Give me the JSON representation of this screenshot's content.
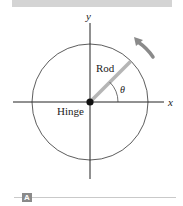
{
  "figure": {
    "tag": "A",
    "labels": {
      "y_axis": "y",
      "x_axis": "x",
      "rod": "Rod",
      "hinge": "Hinge",
      "angle": "θ"
    },
    "colors": {
      "rod": "#b5b5b5",
      "arrow": "#8a8a8a",
      "axes": "#222222",
      "band": "#d4d4d4",
      "tag_bg": "#8a8a8a"
    },
    "geometry": {
      "center": [
        90,
        102
      ],
      "circle_radius": 58,
      "rod_angle_deg": 45,
      "rotation_direction": "counterclockwise"
    }
  }
}
